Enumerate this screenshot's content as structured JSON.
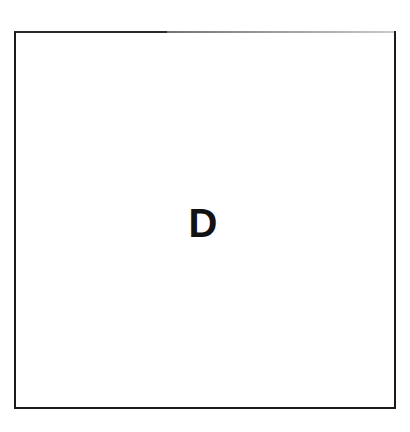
{
  "figure": {
    "background_color": "#ffffff",
    "panel": {
      "label": "D",
      "border_color": "#1b1b1b",
      "fill_color": "#ffffff"
    }
  }
}
